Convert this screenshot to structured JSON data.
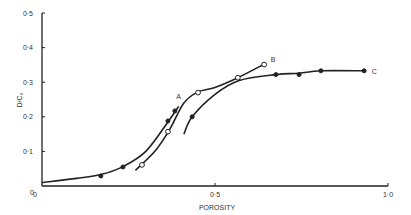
{
  "chart_data": {
    "type": "line",
    "title": "",
    "xlabel": "POROSITY",
    "ylabel": "D/C₀",
    "xlim": [
      0,
      1.0
    ],
    "ylim": [
      0,
      0.5
    ],
    "x_ticks": [
      "0",
      "0·5",
      "1·0"
    ],
    "y_ticks": [
      "0",
      "0·1",
      "0·2",
      "0·3",
      "0·4",
      "0·5"
    ],
    "grid": false,
    "legend": "none (curves labelled inline A, B, C)",
    "series": [
      {
        "name": "A",
        "marker": "filled-circle",
        "points": [
          [
            0.17,
            0.029
          ],
          [
            0.234,
            0.055
          ],
          [
            0.364,
            0.188
          ],
          [
            0.384,
            0.217
          ]
        ],
        "curve": [
          [
            0.0,
            0.01
          ],
          [
            0.1,
            0.022
          ],
          [
            0.17,
            0.033
          ],
          [
            0.234,
            0.056
          ],
          [
            0.3,
            0.1
          ],
          [
            0.364,
            0.185
          ],
          [
            0.395,
            0.23
          ]
        ]
      },
      {
        "name": "B",
        "marker": "open-circle",
        "points": [
          [
            0.289,
            0.061
          ],
          [
            0.364,
            0.157
          ],
          [
            0.451,
            0.27
          ],
          [
            0.566,
            0.313
          ],
          [
            0.642,
            0.351
          ]
        ],
        "curve": [
          [
            0.27,
            0.045
          ],
          [
            0.33,
            0.105
          ],
          [
            0.37,
            0.165
          ],
          [
            0.41,
            0.24
          ],
          [
            0.451,
            0.272
          ],
          [
            0.5,
            0.285
          ],
          [
            0.566,
            0.313
          ],
          [
            0.642,
            0.352
          ]
        ]
      },
      {
        "name": "C",
        "marker": "filled-circle",
        "points": [
          [
            0.434,
            0.2
          ],
          [
            0.676,
            0.322
          ],
          [
            0.743,
            0.322
          ],
          [
            0.806,
            0.333
          ],
          [
            0.931,
            0.333
          ]
        ],
        "curve": [
          [
            0.41,
            0.15
          ],
          [
            0.434,
            0.2
          ],
          [
            0.5,
            0.265
          ],
          [
            0.57,
            0.305
          ],
          [
            0.676,
            0.322
          ],
          [
            0.743,
            0.326
          ],
          [
            0.806,
            0.333
          ],
          [
            0.931,
            0.333
          ]
        ]
      }
    ],
    "annotations": [
      {
        "text": "A",
        "x": 0.395,
        "y": 0.26
      },
      {
        "text": "B",
        "x": 0.668,
        "y": 0.365
      },
      {
        "text": "C",
        "x": 0.96,
        "y": 0.332
      }
    ]
  }
}
